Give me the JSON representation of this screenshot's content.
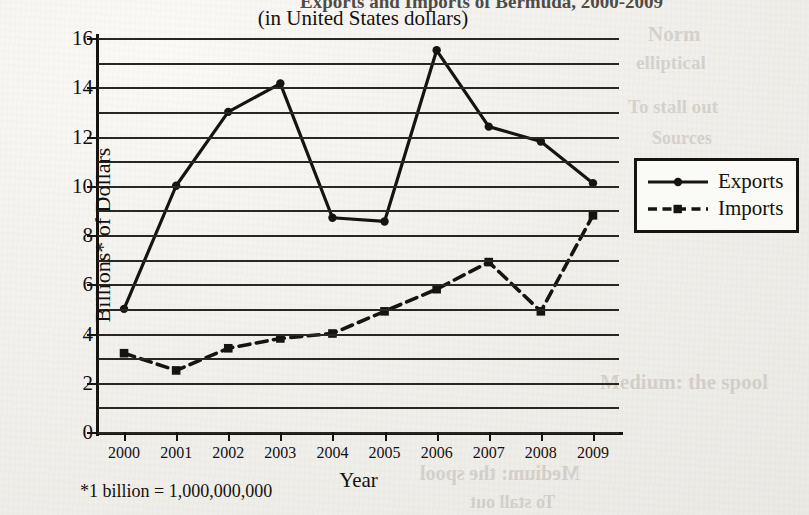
{
  "page": {
    "title_top": "Exports and Imports of Bermuda, 2000-2009",
    "subtitle": "(in United States dollars)",
    "footnote": "*1 billion = 1,000,000,000",
    "ghost_text": [
      "Medium: the spool",
      "Norm",
      "elliptical",
      "To stall out",
      "Sources"
    ]
  },
  "legend": {
    "position": "right",
    "entries": [
      {
        "label": "Exports",
        "style": "solid",
        "marker": "circle"
      },
      {
        "label": "Imports",
        "style": "dashed",
        "marker": "square"
      }
    ]
  },
  "chart_data": {
    "type": "line",
    "title": "Exports and Imports of Bermuda, 2000-2009",
    "subtitle": "(in United States dollars)",
    "xlabel": "Year",
    "ylabel": "Billions* of Dollars",
    "categories": [
      "2000",
      "2001",
      "2002",
      "2003",
      "2004",
      "2005",
      "2006",
      "2007",
      "2008",
      "2009"
    ],
    "ylim": [
      0,
      16
    ],
    "yticks": [
      0,
      2,
      4,
      6,
      8,
      10,
      12,
      14,
      16
    ],
    "gridline_interval": 1,
    "grid": true,
    "series": [
      {
        "name": "Exports",
        "style": "solid",
        "marker": "circle",
        "values": [
          5.0,
          10.0,
          13.0,
          14.15,
          8.7,
          8.55,
          15.5,
          12.4,
          11.8,
          10.1
        ]
      },
      {
        "name": "Imports",
        "style": "dashed",
        "marker": "square",
        "values": [
          3.2,
          2.5,
          3.4,
          3.8,
          4.0,
          4.9,
          5.8,
          6.9,
          4.9,
          8.8
        ]
      }
    ],
    "footnote": "*1 billion = 1,000,000,000"
  },
  "colors": {
    "ink": "#17140f",
    "paper": "#f2f0ec"
  }
}
